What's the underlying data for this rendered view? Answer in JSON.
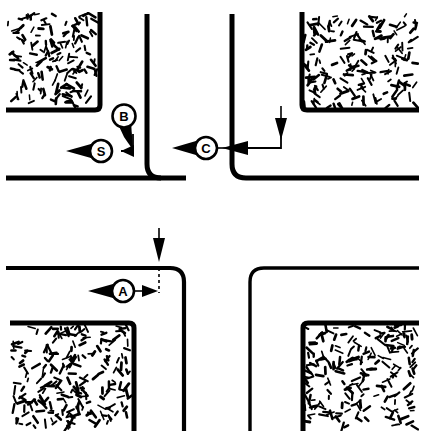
{
  "figure": {
    "type": "technical-line-drawing",
    "background_color": "#ffffff",
    "ink_color": "#000000",
    "width": 425,
    "height": 435
  },
  "callouts": [
    {
      "id": "callout-b",
      "label": "B",
      "marker_style": "balloon-pin",
      "cx": 124,
      "cy": 116,
      "r": 11,
      "points_to": "horizontal-dimension-line",
      "quadrant": "top-left"
    },
    {
      "id": "callout-s",
      "label": "S",
      "marker_style": "circle-with-left-arrow",
      "cx": 101,
      "cy": 151,
      "r": 11,
      "quadrant": "top-left"
    },
    {
      "id": "callout-c",
      "label": "C",
      "marker_style": "circle-with-left-arrow",
      "cx": 206,
      "cy": 148,
      "r": 11,
      "quadrant": "top-right"
    },
    {
      "id": "callout-a",
      "label": "A",
      "marker_style": "circle-with-left-arrow",
      "cx": 123,
      "cy": 291,
      "r": 11,
      "quadrant": "bottom-left"
    }
  ],
  "quadrants": [
    {
      "id": "quadrant-top-left",
      "texture_block": "aggregate-fill",
      "wall_corner": "inner-rounded"
    },
    {
      "id": "quadrant-top-right",
      "texture_block": "aggregate-fill",
      "wall_corner": "inner-rounded"
    },
    {
      "id": "quadrant-bottom-left",
      "texture_block": "aggregate-fill",
      "wall_corner": "outer-rounded"
    },
    {
      "id": "quadrant-bottom-right",
      "texture_block": "aggregate-fill",
      "wall_corner": "outer-rounded"
    }
  ],
  "annotations": [
    {
      "id": "arrow-down-top-right",
      "style": "dimension-arrow-down",
      "x": 281,
      "y_from": 106,
      "y_to": 138
    },
    {
      "id": "arrow-down-bottom-left",
      "style": "dimension-arrow-down",
      "x": 159,
      "y_from": 228,
      "y_to": 258
    },
    {
      "id": "arrow-left-top-left",
      "style": "dimension-arrow-left"
    },
    {
      "id": "arrow-left-top-right",
      "style": "dimension-arrow-left"
    },
    {
      "id": "arrow-right-bottom-left",
      "style": "dimension-arrow-right"
    }
  ],
  "texture": {
    "name": "aggregate-speckle",
    "description": "random short dashes representing concrete aggregate fill",
    "seed": 20240510,
    "density": 150
  }
}
